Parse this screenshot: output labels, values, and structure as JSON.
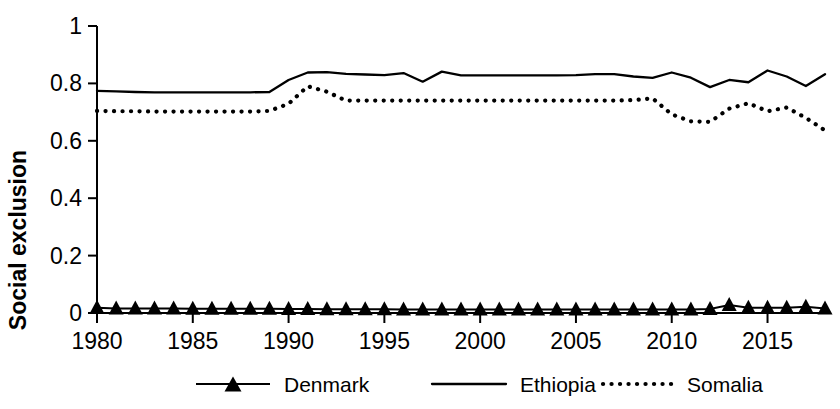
{
  "chart_data": {
    "type": "line",
    "title": "",
    "xlabel": "",
    "ylabel": "Social exclusion",
    "xlim": [
      1980,
      2018
    ],
    "ylim": [
      0,
      1
    ],
    "grid": false,
    "legend_position": "bottom",
    "x": [
      1980,
      1981,
      1982,
      1983,
      1984,
      1985,
      1986,
      1987,
      1988,
      1989,
      1990,
      1991,
      1992,
      1993,
      1994,
      1995,
      1996,
      1997,
      1998,
      1999,
      2000,
      2001,
      2002,
      2003,
      2004,
      2005,
      2006,
      2007,
      2008,
      2009,
      2010,
      2011,
      2012,
      2013,
      2014,
      2015,
      2016,
      2017,
      2018
    ],
    "xticks": [
      1980,
      1985,
      1990,
      1995,
      2000,
      2005,
      2010,
      2015
    ],
    "xtick_labels": [
      "1980",
      "1985",
      "1990",
      "1995",
      "2000",
      "2005",
      "2010",
      "2015"
    ],
    "yticks": [
      0,
      0.2,
      0.4,
      0.6,
      0.8,
      1
    ],
    "ytick_labels": [
      "0",
      "0.2",
      "0.4",
      "0.6",
      "0.8",
      "1"
    ],
    "series": [
      {
        "name": "Denmark",
        "style": "line-marker-triangle",
        "values": [
          0.018,
          0.016,
          0.016,
          0.016,
          0.016,
          0.015,
          0.015,
          0.015,
          0.015,
          0.015,
          0.014,
          0.014,
          0.013,
          0.013,
          0.013,
          0.013,
          0.012,
          0.012,
          0.012,
          0.012,
          0.012,
          0.012,
          0.012,
          0.012,
          0.012,
          0.012,
          0.012,
          0.012,
          0.012,
          0.012,
          0.012,
          0.012,
          0.014,
          0.028,
          0.018,
          0.018,
          0.018,
          0.022,
          0.016
        ]
      },
      {
        "name": "Ethiopia",
        "style": "solid",
        "values": [
          0.774,
          0.772,
          0.77,
          0.769,
          0.769,
          0.769,
          0.769,
          0.769,
          0.769,
          0.77,
          0.812,
          0.838,
          0.839,
          0.833,
          0.831,
          0.829,
          0.836,
          0.806,
          0.841,
          0.828,
          0.828,
          0.828,
          0.828,
          0.828,
          0.828,
          0.829,
          0.832,
          0.832,
          0.824,
          0.819,
          0.838,
          0.82,
          0.787,
          0.812,
          0.804,
          0.845,
          0.824,
          0.791,
          0.832
        ]
      },
      {
        "name": "Somalia",
        "style": "dotted",
        "values": [
          0.704,
          0.703,
          0.703,
          0.702,
          0.702,
          0.702,
          0.702,
          0.702,
          0.702,
          0.704,
          0.729,
          0.79,
          0.771,
          0.74,
          0.74,
          0.74,
          0.74,
          0.74,
          0.74,
          0.74,
          0.74,
          0.74,
          0.74,
          0.74,
          0.74,
          0.74,
          0.74,
          0.74,
          0.742,
          0.748,
          0.692,
          0.668,
          0.666,
          0.712,
          0.731,
          0.703,
          0.716,
          0.68,
          0.636
        ]
      }
    ],
    "legend": [
      {
        "label": "Denmark",
        "style": "line-marker-triangle"
      },
      {
        "label": "Ethiopia",
        "style": "solid"
      },
      {
        "label": "Somalia",
        "style": "dotted"
      }
    ],
    "colors": {
      "line": "#000000",
      "text": "#000000",
      "background": "#ffffff"
    }
  }
}
